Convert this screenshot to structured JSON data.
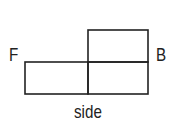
{
  "diagram": {
    "labels": {
      "front": "F",
      "back": "B",
      "caption": "side"
    },
    "stroke_color": "#222222",
    "cells": [
      {
        "id": "bottom-left",
        "x": 25,
        "y": 62,
        "w": 63,
        "h": 32
      },
      {
        "id": "bottom-right",
        "x": 88,
        "y": 62,
        "w": 60,
        "h": 32
      },
      {
        "id": "top-right",
        "x": 88,
        "y": 30,
        "w": 60,
        "h": 32
      }
    ]
  }
}
